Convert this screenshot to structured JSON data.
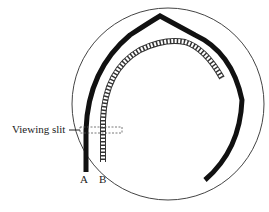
{
  "diagram": {
    "labels": {
      "viewing_slit": "Viewing slit",
      "track_a": "A",
      "track_b": "B"
    },
    "colors": {
      "outline": "#444444",
      "track_a": "#111111",
      "track_b": "#333333"
    }
  }
}
